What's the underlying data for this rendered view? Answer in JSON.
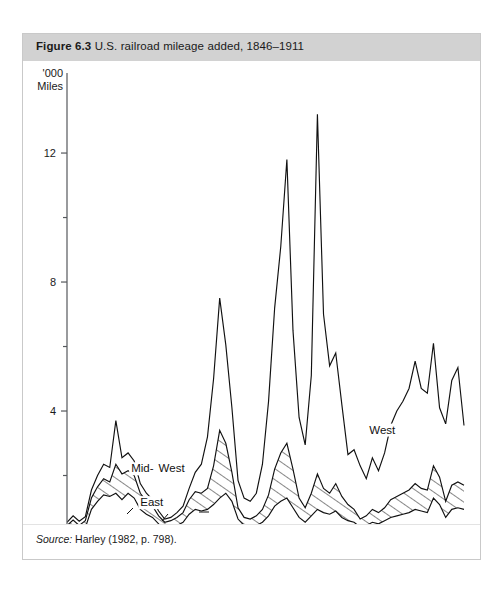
{
  "figure": {
    "number_label": "Figure 6.3",
    "caption": "U.S. railroad mileage added, 1846–1911",
    "source_label": "Source:",
    "source_text": " Harley (1982, p. 798)."
  },
  "chart_data": {
    "type": "area",
    "title": "U.S. railroad mileage added, 1846–1911",
    "xlabel": "",
    "ylabel": "'000 Miles",
    "ylabel_line1": "'000",
    "ylabel_line2": "Miles",
    "xlim": [
      1846,
      1911
    ],
    "ylim": [
      0,
      13.8
    ],
    "grid": false,
    "stacked": true,
    "legend_position": "inline-annotations",
    "x_ticks_major": [
      1850,
      1870,
      1890,
      1910
    ],
    "x_ticks_minor": [
      1860,
      1880,
      1900
    ],
    "x_tick_labels": [
      "1850",
      "1870",
      "1890",
      "1910"
    ],
    "y_ticks_major": [
      4,
      8,
      12
    ],
    "y_ticks_minor": [
      2,
      6,
      10
    ],
    "y_tick_labels": [
      "4",
      "8",
      "12"
    ],
    "annotations": [
      {
        "text": "Mid-",
        "x": 1856.5,
        "y": 2.1,
        "series": "Mid-West"
      },
      {
        "text": "West",
        "x": 1861.0,
        "y": 2.1,
        "series": "Mid-West"
      },
      {
        "text": "East",
        "x": 1858.0,
        "y": 1.05,
        "series": "East"
      },
      {
        "text": "West",
        "x": 1895.5,
        "y": 3.3,
        "series": "West"
      }
    ],
    "x": [
      1846,
      1847,
      1848,
      1849,
      1850,
      1851,
      1852,
      1853,
      1854,
      1855,
      1856,
      1857,
      1858,
      1859,
      1860,
      1861,
      1862,
      1863,
      1864,
      1865,
      1866,
      1867,
      1868,
      1869,
      1870,
      1871,
      1872,
      1873,
      1874,
      1875,
      1876,
      1877,
      1878,
      1879,
      1880,
      1881,
      1882,
      1883,
      1884,
      1885,
      1886,
      1887,
      1888,
      1889,
      1890,
      1891,
      1892,
      1893,
      1894,
      1895,
      1896,
      1897,
      1898,
      1899,
      1900,
      1901,
      1902,
      1903,
      1904,
      1905,
      1906,
      1907,
      1908,
      1909,
      1910,
      1911
    ],
    "series": [
      {
        "name": "East",
        "order": 1,
        "fill": "white",
        "values": [
          0.3,
          0.42,
          0.28,
          0.38,
          0.95,
          1.2,
          1.4,
          1.35,
          1.45,
          1.25,
          1.45,
          1.3,
          0.95,
          0.8,
          0.7,
          0.5,
          0.35,
          0.4,
          0.45,
          0.55,
          0.8,
          0.95,
          0.9,
          0.95,
          1.1,
          1.3,
          1.45,
          1.2,
          0.65,
          0.45,
          0.4,
          0.45,
          0.55,
          0.75,
          1.05,
          1.2,
          1.3,
          1.0,
          0.7,
          0.55,
          0.75,
          0.95,
          0.85,
          0.8,
          0.9,
          0.7,
          0.6,
          0.55,
          0.4,
          0.45,
          0.55,
          0.5,
          0.6,
          0.7,
          0.75,
          0.8,
          0.85,
          0.95,
          0.9,
          0.85,
          1.3,
          1.1,
          0.7,
          0.95,
          1.0,
          0.95
        ]
      },
      {
        "name": "Mid-West",
        "order": 2,
        "fill": "hatched",
        "cumulative_values": [
          0.45,
          0.62,
          0.45,
          0.6,
          1.3,
          1.65,
          1.9,
          1.8,
          2.35,
          2.05,
          2.15,
          2.0,
          1.45,
          1.2,
          1.05,
          0.75,
          0.55,
          0.6,
          0.7,
          0.85,
          1.25,
          1.5,
          1.45,
          1.6,
          2.3,
          3.4,
          3.0,
          2.1,
          1.0,
          0.7,
          0.65,
          0.75,
          0.95,
          1.4,
          2.2,
          2.7,
          3.0,
          2.2,
          1.3,
          1.0,
          1.45,
          2.05,
          1.6,
          1.45,
          1.75,
          1.35,
          1.1,
          0.95,
          0.65,
          0.75,
          0.95,
          0.85,
          1.0,
          1.25,
          1.35,
          1.45,
          1.55,
          1.75,
          1.6,
          1.55,
          2.3,
          1.95,
          1.2,
          1.7,
          1.8,
          1.7
        ]
      },
      {
        "name": "West",
        "order": 3,
        "fill": "white",
        "cumulative_values": [
          0.55,
          0.75,
          0.58,
          0.72,
          1.55,
          2.0,
          2.35,
          2.25,
          3.7,
          2.55,
          2.7,
          2.45,
          1.75,
          1.45,
          1.25,
          0.9,
          0.65,
          0.7,
          0.85,
          1.05,
          1.6,
          2.1,
          2.35,
          3.2,
          5.0,
          7.5,
          6.05,
          4.1,
          1.85,
          1.3,
          1.2,
          1.45,
          2.35,
          4.3,
          7.2,
          9.1,
          11.8,
          6.5,
          3.8,
          2.95,
          5.1,
          13.2,
          7.0,
          5.4,
          5.8,
          4.2,
          2.65,
          2.8,
          2.3,
          1.9,
          2.55,
          2.15,
          2.7,
          3.55,
          4.0,
          4.3,
          4.7,
          5.55,
          4.7,
          4.55,
          6.1,
          4.1,
          3.6,
          4.95,
          5.35,
          3.55
        ]
      }
    ]
  }
}
